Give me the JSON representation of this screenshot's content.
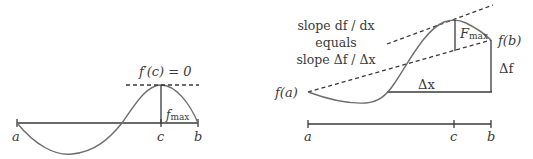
{
  "left_diagram": {
    "title_label": "f′(c) = 0",
    "fmax_label": {
      "main": "f",
      "sub": "max"
    },
    "axis_labels": {
      "a": "a",
      "c": "c",
      "b": "b"
    }
  },
  "right_diagram": {
    "slope_text": {
      "line1": "slope df / dx",
      "line2": "equals",
      "line3": "slope Δf / Δx"
    },
    "fa_label": "f(a)",
    "fb_label": "f(b)",
    "Fmax_label": {
      "main": "F",
      "sub": "max"
    },
    "dx_label": "Δx",
    "df_label": "Δf",
    "axis_labels": {
      "a": "a",
      "c": "c",
      "b": "b"
    }
  },
  "colors": {
    "line": "#3a3a3a",
    "curve": "#6e6e6e"
  }
}
